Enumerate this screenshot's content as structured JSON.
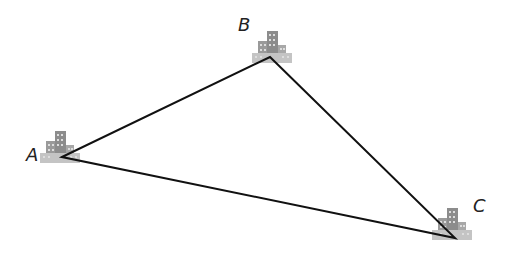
{
  "diagram": {
    "type": "triangle-between-cities",
    "vertices": [
      {
        "label": "A",
        "x": 62,
        "y": 157
      },
      {
        "label": "B",
        "x": 270,
        "y": 57
      },
      {
        "label": "C",
        "x": 455,
        "y": 238
      }
    ],
    "colors": {
      "line": "#111111",
      "building_dark": "#8a8a8a",
      "building_light": "#bdbdbd"
    }
  }
}
